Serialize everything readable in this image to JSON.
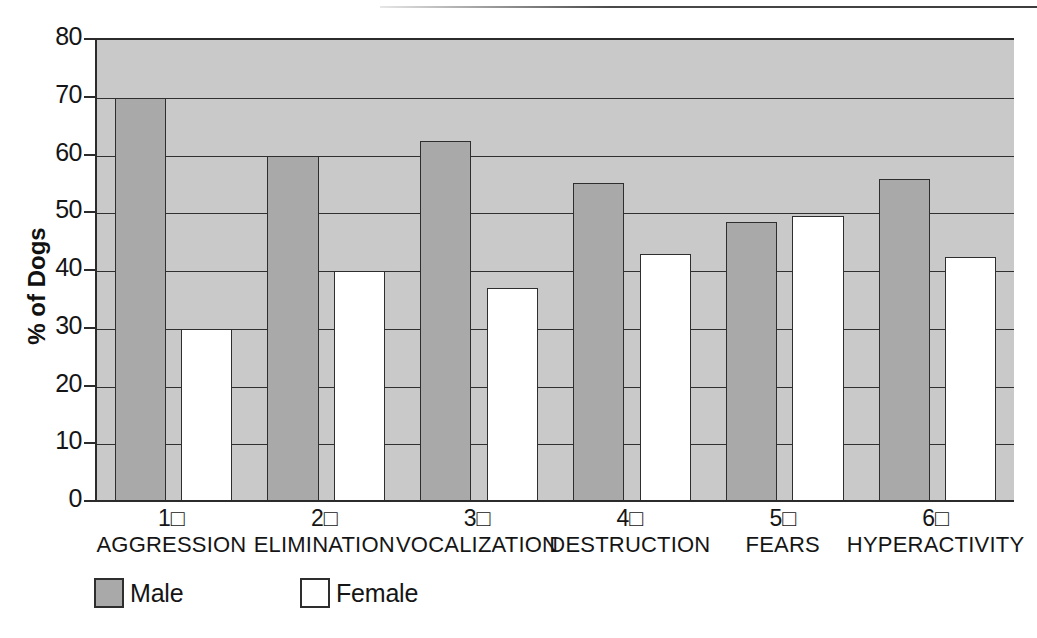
{
  "chart_data": {
    "type": "bar",
    "title": "",
    "subtitle": "",
    "xlabel": "",
    "ylabel": "% of Dogs",
    "ylim": [
      0,
      80
    ],
    "ytick_step": 10,
    "ytick_labels": [
      "80",
      "70",
      "60",
      "50",
      "40",
      "30",
      "20",
      "10",
      "0"
    ],
    "ytick_values": [
      80,
      70,
      60,
      50,
      40,
      30,
      20,
      10,
      0
    ],
    "grid": true,
    "grid_axis": "y",
    "legend_position": "bottom-left",
    "categories": [
      "AGGRESSION",
      "ELIMINATION",
      "VOCALIZATION",
      "DESTRUCTION",
      "FEARS",
      "HYPERACTIVITY"
    ],
    "category_numbers": [
      "1□",
      "2□",
      "3□",
      "4□",
      "5□",
      "6□"
    ],
    "series": [
      {
        "name": "Male",
        "color": "#a9a9a9",
        "values": [
          70,
          60,
          62.5,
          55.3,
          48.5,
          56
        ]
      },
      {
        "name": "Female",
        "color": "#ffffff",
        "values": [
          30,
          40,
          37,
          43,
          49.5,
          42.5
        ]
      }
    ]
  },
  "colors": {
    "plot_background": "#c9c9c9",
    "male_bar": "#a9a9a9",
    "female_bar": "#ffffff",
    "axis_line": "#2b2b2b",
    "gridline": "#303030",
    "text": "#151515"
  }
}
